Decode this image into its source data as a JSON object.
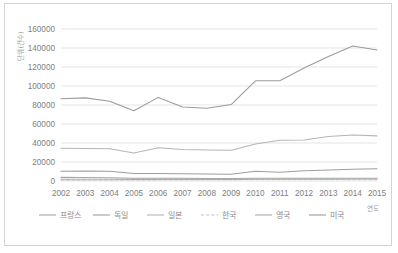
{
  "chart_data": {
    "type": "line",
    "title": "",
    "xlabel": "연도",
    "ylabel": "단위(건수)",
    "x": [
      2002,
      2003,
      2004,
      2005,
      2006,
      2007,
      2008,
      2009,
      2010,
      2011,
      2012,
      2013,
      2014,
      2015
    ],
    "categories": [
      "2002",
      "2003",
      "2004",
      "2005",
      "2006",
      "2007",
      "2008",
      "2009",
      "2010",
      "2011",
      "2012",
      "2013",
      "2014",
      "2015"
    ],
    "ylim": [
      0,
      160000
    ],
    "ytick_labels": [
      "160000",
      "140000",
      "120000",
      "100000",
      "80000",
      "60000",
      "40000",
      "20000",
      "0"
    ],
    "ytick_values": [
      160000,
      140000,
      120000,
      100000,
      80000,
      60000,
      40000,
      20000,
      0
    ],
    "grid": true,
    "legend_position": "bottom",
    "series": [
      {
        "name": "프랑스",
        "color": "#a6a6a6",
        "dash": "none",
        "values": [
          3800,
          3600,
          3400,
          2900,
          2900,
          2800,
          2700,
          2700,
          2800,
          2900,
          3000,
          3000,
          3000,
          2900
        ]
      },
      {
        "name": "독일",
        "color": "#9e9e9e",
        "dash": "none",
        "values": [
          10300,
          10400,
          10300,
          7800,
          7900,
          7700,
          7300,
          7200,
          10200,
          9300,
          10800,
          11500,
          12400,
          12800
        ]
      },
      {
        "name": "일본",
        "color": "#b5b5b5",
        "dash": "none",
        "values": [
          34500,
          34300,
          34000,
          29500,
          35000,
          33200,
          32600,
          32300,
          39000,
          43000,
          43200,
          46800,
          48500,
          47500
        ]
      },
      {
        "name": "한국",
        "color": "#c0c0c0",
        "dash": "dashed",
        "values": [
          1100,
          1100,
          1100,
          1100,
          1200,
          1300,
          1300,
          1400,
          1600,
          1700,
          1800,
          1900,
          2000,
          2000
        ]
      },
      {
        "name": "영국",
        "color": "#adadad",
        "dash": "none",
        "values": [
          1900,
          1900,
          1800,
          1700,
          1700,
          1700,
          1700,
          1700,
          1900,
          1900,
          2000,
          2000,
          2100,
          2100
        ]
      },
      {
        "name": "미국",
        "color": "#9c9c9c",
        "dash": "none",
        "values": [
          86500,
          87500,
          84000,
          74000,
          88000,
          78000,
          76500,
          80500,
          105500,
          105500,
          119000,
          131000,
          142000,
          138000
        ]
      }
    ]
  },
  "legend": {
    "items": [
      {
        "label": "프랑스"
      },
      {
        "label": "독일"
      },
      {
        "label": "일본"
      },
      {
        "label": "한국"
      },
      {
        "label": "영국"
      },
      {
        "label": "미국"
      }
    ]
  }
}
